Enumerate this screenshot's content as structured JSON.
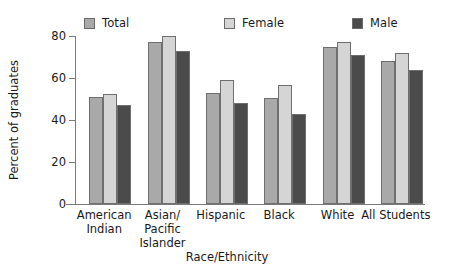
{
  "chart_data": {
    "type": "bar",
    "title": "",
    "xlabel": "Race/Ethnicity",
    "ylabel": "Percent of graduates",
    "ylim": [
      0,
      80
    ],
    "yticks": [
      0,
      20,
      40,
      60,
      80
    ],
    "ytick_labels": [
      "0",
      "20",
      "40",
      "60",
      "80"
    ],
    "grid": false,
    "legend_position": "top",
    "categories": [
      "American\nIndian",
      "Asian/\nPacific\nIslander",
      "Hispanic",
      "Black",
      "White",
      "All Students"
    ],
    "series": [
      {
        "name": "Total",
        "color": "#a9a9a9",
        "values": [
          51,
          77,
          53,
          50.5,
          75,
          68
        ]
      },
      {
        "name": "Female",
        "color": "#d5d5d5",
        "values": [
          52.5,
          80,
          59,
          56.5,
          77,
          72
        ]
      },
      {
        "name": "Male",
        "color": "#4b4b4b",
        "values": [
          47,
          73,
          48,
          43,
          71,
          64
        ]
      }
    ]
  },
  "legend": {
    "items": [
      {
        "label": "Total"
      },
      {
        "label": "Female"
      },
      {
        "label": "Male"
      }
    ]
  },
  "colors": {
    "total": "#a9a9a9",
    "female": "#d5d5d5",
    "male": "#4b4b4b",
    "axis": "#7a7a7a",
    "text": "#1a1a1a",
    "background": "#ffffff"
  }
}
